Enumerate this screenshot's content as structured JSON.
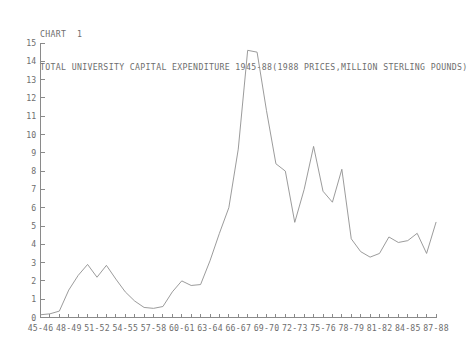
{
  "chart_data": {
    "type": "line",
    "title": "TOTAL UNIVERSITY CAPITAL EXPENDITURE 1945-88(1988 PRICES,MILLION STERLING POUNDS)",
    "chart_number_label": "CHART  1",
    "xlabel": "",
    "ylabel": "",
    "ylim": [
      0,
      15
    ],
    "ytick_values": [
      0,
      1,
      2,
      3,
      4,
      5,
      6,
      7,
      8,
      9,
      10,
      11,
      12,
      13,
      14,
      15
    ],
    "ytick_labels": [
      "0",
      "1",
      "2",
      "3",
      "4",
      "5",
      "6",
      "7",
      "8",
      "9",
      "10",
      "11",
      "12",
      "13",
      "14",
      "15"
    ],
    "grid": false,
    "legend": false,
    "line_color": "#909090",
    "axis_color": "#8a8a8a",
    "text_color": "#6e6e6e",
    "background_color": "#ffffff",
    "categories": [
      "45-46",
      "46-47",
      "47-48",
      "48-49",
      "49-50",
      "50-51",
      "51-52",
      "52-53",
      "53-54",
      "54-55",
      "55-56",
      "56-57",
      "57-58",
      "58-59",
      "59-60",
      "60-61",
      "61-62",
      "62-63",
      "63-64",
      "64-65",
      "65-66",
      "66-67",
      "67-68",
      "68-69",
      "69-70",
      "70-71",
      "71-72",
      "72-73",
      "73-74",
      "74-75",
      "75-76",
      "76-77",
      "77-78",
      "78-79",
      "79-80",
      "80-81",
      "81-82",
      "82-83",
      "83-84",
      "84-85",
      "85-86",
      "86-87",
      "87-88"
    ],
    "xtick_labels": [
      "45-46",
      "",
      "",
      "48-49",
      "",
      "",
      "51-52",
      "",
      "",
      "54-55",
      "",
      "",
      "57-58",
      "",
      "",
      "60-61",
      "",
      "",
      "63-64",
      "",
      "",
      "66-67",
      "",
      "",
      "69-70",
      "",
      "",
      "72-73",
      "",
      "",
      "75-76",
      "",
      "",
      "78-79",
      "",
      "",
      "81-82",
      "",
      "",
      "84-85",
      "",
      "",
      "87-88"
    ],
    "values": [
      0.15,
      0.2,
      0.35,
      1.5,
      2.3,
      2.9,
      2.2,
      2.85,
      2.1,
      1.4,
      0.9,
      0.55,
      0.5,
      0.6,
      1.4,
      2.0,
      1.75,
      1.8,
      3.1,
      4.6,
      6.0,
      9.2,
      14.6,
      14.5,
      11.3,
      8.4,
      8.0,
      5.2,
      7.0,
      9.35,
      6.9,
      6.3,
      8.1,
      4.3,
      3.6,
      3.3,
      3.5,
      4.4,
      4.1,
      4.2,
      4.6,
      3.5,
      5.2
    ],
    "peak_annotation": {
      "year": "67-68",
      "value": 14.6
    }
  }
}
